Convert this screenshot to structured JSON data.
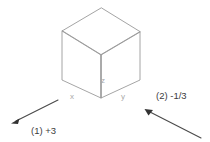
{
  "figure": {
    "background_color": "#ffffff",
    "cube": {
      "name": "isometric-cube",
      "stroke_color": "#9a9a9a",
      "vertices": {
        "top_apex": [
          101,
          8
        ],
        "left_top": [
          62,
          31
        ],
        "right_top": [
          140,
          32
        ],
        "center_front_top": [
          101,
          55
        ],
        "left_bottom": [
          62,
          80
        ],
        "right_bottom": [
          140,
          80
        ],
        "bottom_front": [
          101,
          98
        ]
      },
      "labels": [
        {
          "text": "x",
          "x": 72,
          "y": 99,
          "color": "#a8a8a8"
        },
        {
          "text": "y",
          "x": 123,
          "y": 99,
          "color": "#a8a8a8"
        },
        {
          "text": "z",
          "x": 103,
          "y": 83,
          "color": "#a8a8a8"
        }
      ]
    },
    "vectors": [
      {
        "id": "vector-1",
        "label": "(1) +3",
        "label_x": 31,
        "label_y": 134,
        "tail": [
          58,
          100
        ],
        "tip": [
          13,
          122
        ],
        "color": "#4a4a4a",
        "direction": "down-left"
      },
      {
        "id": "vector-2",
        "label": "(2) -1/3",
        "label_x": 156,
        "label_y": 99,
        "tail": [
          201,
          138
        ],
        "tip": [
          146,
          110
        ],
        "color": "#4a4a4a",
        "direction": "up-left"
      }
    ]
  }
}
